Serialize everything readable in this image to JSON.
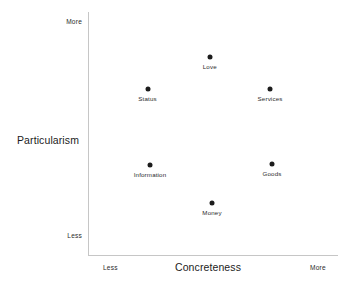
{
  "chart_data": {
    "type": "scatter",
    "title": "",
    "xlabel": "Concreteness",
    "ylabel": "Particularism",
    "xlim": [
      0,
      1
    ],
    "ylim": [
      0,
      1
    ],
    "grid": false,
    "legend": null,
    "x_tick_labels": [
      "Less",
      "More"
    ],
    "y_tick_labels": [
      "Less",
      "More"
    ],
    "x_axis_low_label": "Less",
    "x_axis_high_label": "More",
    "y_axis_low_label": "Less",
    "y_axis_high_label": "More",
    "point_color": "#1c1c1c",
    "axis_color": "#c6c6c6",
    "points": [
      {
        "label": "Love",
        "x": 0.485,
        "y": 0.815
      },
      {
        "label": "Status",
        "x": 0.235,
        "y": 0.683
      },
      {
        "label": "Services",
        "x": 0.727,
        "y": 0.683
      },
      {
        "label": "Information",
        "x": 0.245,
        "y": 0.37
      },
      {
        "label": "Goods",
        "x": 0.735,
        "y": 0.374
      },
      {
        "label": "Money",
        "x": 0.494,
        "y": 0.214
      }
    ]
  }
}
